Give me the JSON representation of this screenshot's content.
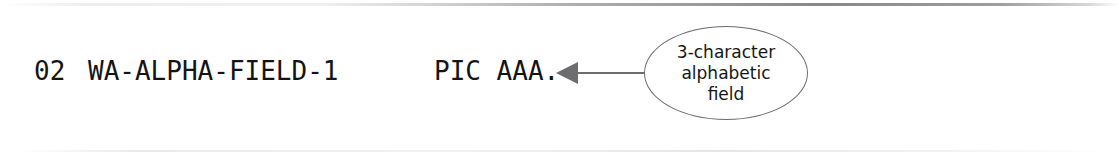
{
  "code": {
    "level": "02",
    "name": "WA-ALPHA-FIELD-1",
    "picture": "PIC AAA."
  },
  "annotation": {
    "line1": "3-character",
    "line2": "alphabetic",
    "line3": "field"
  },
  "colors": {
    "text": "#141414",
    "annotation_text": "#161616",
    "callout_stroke": "#6d6d70",
    "arrow": "#6d6d70",
    "background": "#ffffff"
  }
}
